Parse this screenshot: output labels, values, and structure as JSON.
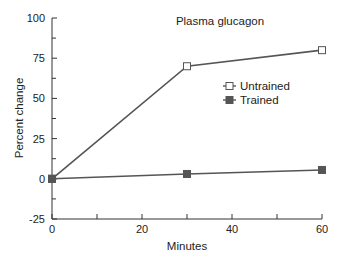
{
  "chart_data": {
    "type": "line",
    "title": "Plasma glucagon",
    "xlabel": "Minutes",
    "ylabel": "Percent change",
    "x": [
      0,
      30,
      60
    ],
    "xlim": [
      0,
      60
    ],
    "ylim": [
      -25,
      100
    ],
    "xticks": [
      0,
      20,
      40,
      60
    ],
    "xticks_minor": [
      10,
      30,
      50
    ],
    "yticks": [
      -25,
      0,
      25,
      50,
      75,
      100
    ],
    "yticks_minor": [
      -12.5,
      12.5,
      37.5,
      62.5,
      87.5
    ],
    "grid": false,
    "legend_position": "right-center",
    "series": [
      {
        "name": "Untrained",
        "marker": "open-square",
        "color": "#555555",
        "values": [
          0,
          70,
          80
        ]
      },
      {
        "name": "Trained",
        "marker": "filled-square",
        "color": "#555555",
        "values": [
          0,
          3,
          5.5
        ]
      }
    ]
  }
}
